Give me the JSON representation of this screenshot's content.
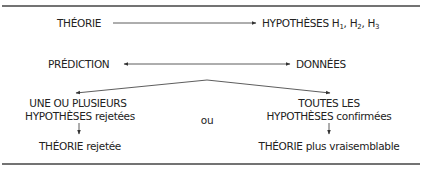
{
  "diagram": {
    "top_left": "THÉORIE",
    "top_right": {
      "prefix": "HYPOTHÈSES H",
      "s1": "1",
      "sep1": ", H",
      "s2": "2",
      "sep2": ", H",
      "s3": "3"
    },
    "mid_left": "PRÉDICTION",
    "mid_right": "DONNÉES",
    "left_branch": {
      "line1": "UNE OU PLUSIEURS",
      "line2_caps": "HYPOTHÈSES",
      "line2_rest": " rejetées",
      "result_caps": "THÉORIE",
      "result_rest": " rejetée"
    },
    "connector": "ou",
    "right_branch": {
      "line1": "TOUTES LES",
      "line2_caps": "HYPOTHÈSES",
      "line2_rest": " confirmées",
      "result_caps": "THÉORIE",
      "result_rest": " plus vraisemblable"
    },
    "colors": {
      "text": "#222222",
      "lines": "#333333",
      "rule": "#444444"
    }
  }
}
